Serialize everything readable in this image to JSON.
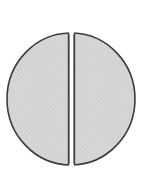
{
  "figure": {
    "name": "bisected-disc",
    "canvas": {
      "width": 150,
      "height": 177,
      "background_color": "#ffffff"
    },
    "disc": {
      "center_x": 71,
      "center_y": 99,
      "radius_x": 64,
      "radius_y": 66,
      "fill_color": "#d6d6d6",
      "outline_color": "#3b3b3b",
      "outline_width": 1.6,
      "texture": "diagonal-hatch",
      "texture_color": "#c3c3c3"
    },
    "slit": {
      "name": "vertical-slit",
      "center_x": 71.5,
      "width": 4.6,
      "top_y": 33,
      "bottom_y": 165,
      "color": "#ffffff",
      "orientation": "vertical"
    },
    "halves": [
      {
        "name": "left-half",
        "label": "Left half",
        "side": "left"
      },
      {
        "name": "right-half",
        "label": "Right half",
        "side": "right"
      }
    ]
  }
}
